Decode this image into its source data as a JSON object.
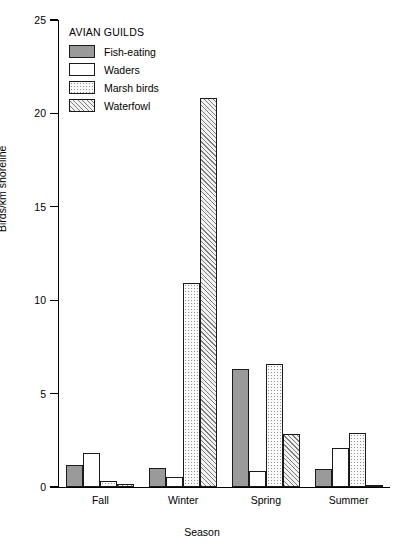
{
  "chart_data": {
    "type": "bar",
    "title": "",
    "xlabel": "Season",
    "ylabel": "Birds/km shoreline",
    "categories": [
      "Fall",
      "Winter",
      "Spring",
      "Summer"
    ],
    "ylim": [
      0,
      25
    ],
    "yticks": [
      0,
      5,
      10,
      15,
      20,
      25
    ],
    "grid": false,
    "legend_title": "AVIAN GUILDS",
    "legend_position": "top-left inside plot",
    "series": [
      {
        "name": "Fish-eating",
        "pattern": "solid-gray",
        "color": "#9a9a9a",
        "values": [
          1.2,
          1.0,
          6.3,
          0.95
        ]
      },
      {
        "name": "Waders",
        "pattern": "white",
        "color": "#ffffff",
        "values": [
          1.8,
          0.55,
          0.85,
          2.1
        ]
      },
      {
        "name": "Marsh birds",
        "pattern": "fine-dots",
        "color": "#fbfbfb",
        "values": [
          0.3,
          10.9,
          6.6,
          2.9
        ]
      },
      {
        "name": "Waterfowl",
        "pattern": "diagonal-hatch",
        "color": "#f2f2f2",
        "values": [
          0.15,
          20.8,
          2.85,
          0.1
        ]
      }
    ]
  },
  "legend": {
    "title": "AVIAN GUILDS",
    "items": [
      {
        "label": "Fish-eating"
      },
      {
        "label": "Waders"
      },
      {
        "label": "Marsh birds"
      },
      {
        "label": "Waterfowl"
      }
    ]
  },
  "axes": {
    "y_label": "Birds/km shoreline",
    "x_label": "Season",
    "y_ticks": [
      "0",
      "5",
      "10",
      "15",
      "20",
      "25"
    ],
    "x_ticks": [
      "Fall",
      "Winter",
      "Spring",
      "Summer"
    ]
  }
}
